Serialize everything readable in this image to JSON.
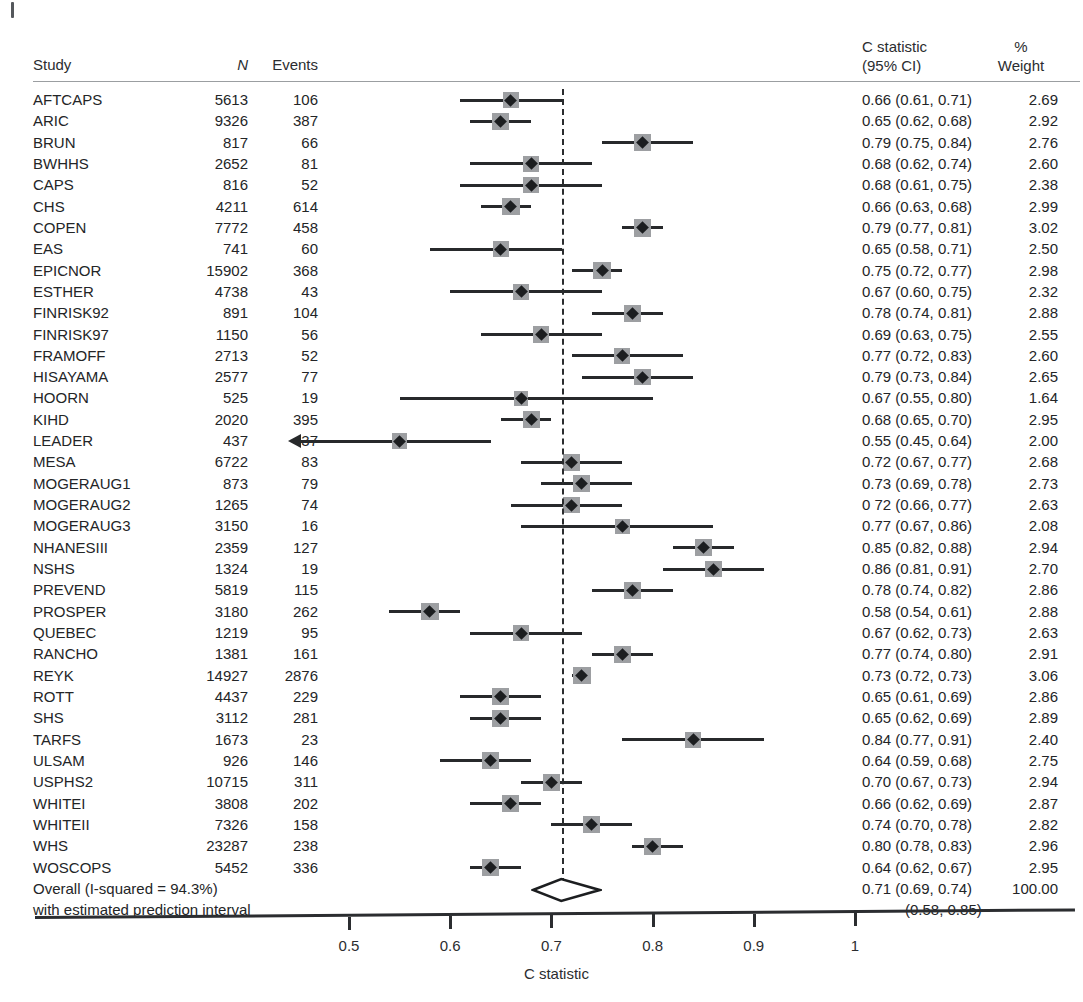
{
  "header": {
    "study": "Study",
    "n": "N",
    "events": "Events",
    "cstat_line1": "C statistic",
    "cstat_line2": "(95% CI)",
    "pct": "%",
    "weight": "Weight"
  },
  "summary": {
    "line1": "Overall (I-squared = 94.3%)",
    "line2": "with estimated prediction interval",
    "ci_label": "0.71 (0.69, 0.74)",
    "weight_label": "100.00",
    "pi_label": "(0.58, 0.85)",
    "estimate": 0.71,
    "lower": 0.69,
    "upper": 0.74,
    "pi_lower": 0.58,
    "pi_upper": 0.85
  },
  "axis": {
    "title": "C statistic",
    "ticks": [
      {
        "value": 0.5,
        "label": "0.5"
      },
      {
        "value": 0.6,
        "label": "0.6"
      },
      {
        "value": 0.7,
        "label": "0.7"
      },
      {
        "value": 0.8,
        "label": "0.8"
      },
      {
        "value": 0.9,
        "label": "0.9"
      },
      {
        "value": 1.0,
        "label": "1"
      }
    ],
    "min": 0.44,
    "max": 1.04
  },
  "colors": {
    "text": "#232527",
    "marker": "#1c1e20",
    "weight_box": "#9d9fa2",
    "line": "#27292b",
    "rule": "#9b9ea1",
    "background": "#ffffff"
  },
  "chart_data": {
    "type": "forest",
    "title": "",
    "xlabel": "C statistic",
    "ylabel": "",
    "xlim": [
      0.44,
      1.04
    ],
    "null_line": 0.71,
    "columns": [
      "Study",
      "N",
      "Events",
      "C statistic (95% CI)",
      "% Weight"
    ],
    "rows": [
      {
        "study": "AFTCAPS",
        "n": "5613",
        "events": "106",
        "est": 0.66,
        "lo": 0.61,
        "hi": 0.71,
        "weight": 2.69,
        "ci_label": "0.66 (0.61, 0.71)",
        "weight_label": "2.69",
        "truncated_left": false
      },
      {
        "study": "ARIC",
        "n": "9326",
        "events": "387",
        "est": 0.65,
        "lo": 0.62,
        "hi": 0.68,
        "weight": 2.92,
        "ci_label": "0.65 (0.62, 0.68)",
        "weight_label": "2.92",
        "truncated_left": false
      },
      {
        "study": "BRUN",
        "n": "817",
        "events": "66",
        "est": 0.79,
        "lo": 0.75,
        "hi": 0.84,
        "weight": 2.76,
        "ci_label": "0.79 (0.75, 0.84)",
        "weight_label": "2.76",
        "truncated_left": false
      },
      {
        "study": "BWHHS",
        "n": "2652",
        "events": "81",
        "est": 0.68,
        "lo": 0.62,
        "hi": 0.74,
        "weight": 2.6,
        "ci_label": "0.68 (0.62, 0.74)",
        "weight_label": "2.60",
        "truncated_left": false
      },
      {
        "study": "CAPS",
        "n": "816",
        "events": "52",
        "est": 0.68,
        "lo": 0.61,
        "hi": 0.75,
        "weight": 2.38,
        "ci_label": "0.68 (0.61, 0.75)",
        "weight_label": "2.38",
        "truncated_left": false
      },
      {
        "study": "CHS",
        "n": "4211",
        "events": "614",
        "est": 0.66,
        "lo": 0.63,
        "hi": 0.68,
        "weight": 2.99,
        "ci_label": "0.66 (0.63, 0.68)",
        "weight_label": "2.99",
        "truncated_left": false
      },
      {
        "study": "COPEN",
        "n": "7772",
        "events": "458",
        "est": 0.79,
        "lo": 0.77,
        "hi": 0.81,
        "weight": 3.02,
        "ci_label": "0.79 (0.77, 0.81)",
        "weight_label": "3.02",
        "truncated_left": false
      },
      {
        "study": "EAS",
        "n": "741",
        "events": "60",
        "est": 0.65,
        "lo": 0.58,
        "hi": 0.71,
        "weight": 2.5,
        "ci_label": "0.65 (0.58, 0.71)",
        "weight_label": "2.50",
        "truncated_left": false
      },
      {
        "study": "EPICNOR",
        "n": "15902",
        "events": "368",
        "est": 0.75,
        "lo": 0.72,
        "hi": 0.77,
        "weight": 2.98,
        "ci_label": "0.75 (0.72, 0.77)",
        "weight_label": "2.98",
        "truncated_left": false
      },
      {
        "study": "ESTHER",
        "n": "4738",
        "events": "43",
        "est": 0.67,
        "lo": 0.6,
        "hi": 0.75,
        "weight": 2.32,
        "ci_label": "0.67 (0.60, 0.75)",
        "weight_label": "2.32",
        "truncated_left": false
      },
      {
        "study": "FINRISK92",
        "n": "891",
        "events": "104",
        "est": 0.78,
        "lo": 0.74,
        "hi": 0.81,
        "weight": 2.88,
        "ci_label": "0.78 (0.74, 0.81)",
        "weight_label": "2.88",
        "truncated_left": false
      },
      {
        "study": "FINRISK97",
        "n": "1150",
        "events": "56",
        "est": 0.69,
        "lo": 0.63,
        "hi": 0.75,
        "weight": 2.55,
        "ci_label": "0.69 (0.63, 0.75)",
        "weight_label": "2.55",
        "truncated_left": false
      },
      {
        "study": "FRAMOFF",
        "n": "2713",
        "events": "52",
        "est": 0.77,
        "lo": 0.72,
        "hi": 0.83,
        "weight": 2.6,
        "ci_label": "0.77 (0.72, 0.83)",
        "weight_label": "2.60",
        "truncated_left": false
      },
      {
        "study": "HISAYAMA",
        "n": "2577",
        "events": "77",
        "est": 0.79,
        "lo": 0.73,
        "hi": 0.84,
        "weight": 2.65,
        "ci_label": "0.79 (0.73, 0.84)",
        "weight_label": "2.65",
        "truncated_left": false
      },
      {
        "study": "HOORN",
        "n": "525",
        "events": "19",
        "est": 0.67,
        "lo": 0.55,
        "hi": 0.8,
        "weight": 1.64,
        "ci_label": "0.67 (0.55, 0.80)",
        "weight_label": "1.64",
        "truncated_left": false
      },
      {
        "study": "KIHD",
        "n": "2020",
        "events": "395",
        "est": 0.68,
        "lo": 0.65,
        "hi": 0.7,
        "weight": 2.95,
        "ci_label": "0.68 (0.65, 0.70)",
        "weight_label": "2.95",
        "truncated_left": false
      },
      {
        "study": "LEADER",
        "n": "437",
        "events": "37",
        "est": 0.55,
        "lo": 0.45,
        "hi": 0.64,
        "weight": 2.0,
        "ci_label": "0.55 (0.45, 0.64)",
        "weight_label": "2.00",
        "truncated_left": true
      },
      {
        "study": "MESA",
        "n": "6722",
        "events": "83",
        "est": 0.72,
        "lo": 0.67,
        "hi": 0.77,
        "weight": 2.68,
        "ci_label": "0.72 (0.67, 0.77)",
        "weight_label": "2.68",
        "truncated_left": false
      },
      {
        "study": "MOGERAUG1",
        "n": "873",
        "events": "79",
        "est": 0.73,
        "lo": 0.69,
        "hi": 0.78,
        "weight": 2.73,
        "ci_label": "0.73 (0.69, 0.78)",
        "weight_label": "2.73",
        "truncated_left": false
      },
      {
        "study": "MOGERAUG2",
        "n": "1265",
        "events": "74",
        "est": 0.72,
        "lo": 0.66,
        "hi": 0.77,
        "weight": 2.63,
        "ci_label": "0 72 (0.66, 0.77)",
        "weight_label": "2.63",
        "truncated_left": false
      },
      {
        "study": "MOGERAUG3",
        "n": "3150",
        "events": "16",
        "est": 0.77,
        "lo": 0.67,
        "hi": 0.86,
        "weight": 2.08,
        "ci_label": "0.77 (0.67, 0.86)",
        "weight_label": "2.08",
        "truncated_left": false
      },
      {
        "study": "NHANESIII",
        "n": "2359",
        "events": "127",
        "est": 0.85,
        "lo": 0.82,
        "hi": 0.88,
        "weight": 2.94,
        "ci_label": "0.85 (0.82, 0.88)",
        "weight_label": "2.94",
        "truncated_left": false
      },
      {
        "study": "NSHS",
        "n": "1324",
        "events": "19",
        "est": 0.86,
        "lo": 0.81,
        "hi": 0.91,
        "weight": 2.7,
        "ci_label": "0.86 (0.81, 0.91)",
        "weight_label": "2.70",
        "truncated_left": false
      },
      {
        "study": "PREVEND",
        "n": "5819",
        "events": "115",
        "est": 0.78,
        "lo": 0.74,
        "hi": 0.82,
        "weight": 2.86,
        "ci_label": "0.78 (0.74, 0.82)",
        "weight_label": "2.86",
        "truncated_left": false
      },
      {
        "study": "PROSPER",
        "n": "3180",
        "events": "262",
        "est": 0.58,
        "lo": 0.54,
        "hi": 0.61,
        "weight": 2.88,
        "ci_label": "0.58 (0.54, 0.61)",
        "weight_label": "2.88",
        "truncated_left": false
      },
      {
        "study": "QUEBEC",
        "n": "1219",
        "events": "95",
        "est": 0.67,
        "lo": 0.62,
        "hi": 0.73,
        "weight": 2.63,
        "ci_label": "0.67 (0.62, 0.73)",
        "weight_label": "2.63",
        "truncated_left": false
      },
      {
        "study": "RANCHO",
        "n": "1381",
        "events": "161",
        "est": 0.77,
        "lo": 0.74,
        "hi": 0.8,
        "weight": 2.91,
        "ci_label": "0.77 (0.74, 0.80)",
        "weight_label": "2.91",
        "truncated_left": false
      },
      {
        "study": "REYK",
        "n": "14927",
        "events": "2876",
        "est": 0.73,
        "lo": 0.72,
        "hi": 0.73,
        "weight": 3.06,
        "ci_label": "0.73 (0.72, 0.73)",
        "weight_label": "3.06",
        "truncated_left": false
      },
      {
        "study": "ROTT",
        "n": "4437",
        "events": "229",
        "est": 0.65,
        "lo": 0.61,
        "hi": 0.69,
        "weight": 2.86,
        "ci_label": "0.65 (0.61, 0.69)",
        "weight_label": "2.86",
        "truncated_left": false
      },
      {
        "study": "SHS",
        "n": "3112",
        "events": "281",
        "est": 0.65,
        "lo": 0.62,
        "hi": 0.69,
        "weight": 2.89,
        "ci_label": "0.65 (0.62, 0.69)",
        "weight_label": "2.89",
        "truncated_left": false
      },
      {
        "study": "TARFS",
        "n": "1673",
        "events": "23",
        "est": 0.84,
        "lo": 0.77,
        "hi": 0.91,
        "weight": 2.4,
        "ci_label": "0.84 (0.77, 0.91)",
        "weight_label": "2.40",
        "truncated_left": false
      },
      {
        "study": "ULSAM",
        "n": "926",
        "events": "146",
        "est": 0.64,
        "lo": 0.59,
        "hi": 0.68,
        "weight": 2.75,
        "ci_label": "0.64 (0.59, 0.68)",
        "weight_label": "2.75",
        "truncated_left": false
      },
      {
        "study": "USPHS2",
        "n": "10715",
        "events": "311",
        "est": 0.7,
        "lo": 0.67,
        "hi": 0.73,
        "weight": 2.94,
        "ci_label": "0.70 (0.67, 0.73)",
        "weight_label": "2.94",
        "truncated_left": false
      },
      {
        "study": "WHITEI",
        "n": "3808",
        "events": "202",
        "est": 0.66,
        "lo": 0.62,
        "hi": 0.69,
        "weight": 2.87,
        "ci_label": "0.66 (0.62, 0.69)",
        "weight_label": "2.87",
        "truncated_left": false
      },
      {
        "study": "WHITEII",
        "n": "7326",
        "events": "158",
        "est": 0.74,
        "lo": 0.7,
        "hi": 0.78,
        "weight": 2.82,
        "ci_label": "0.74 (0.70, 0.78)",
        "weight_label": "2.82",
        "truncated_left": false
      },
      {
        "study": "WHS",
        "n": "23287",
        "events": "238",
        "est": 0.8,
        "lo": 0.78,
        "hi": 0.83,
        "weight": 2.96,
        "ci_label": "0.80 (0.78, 0.83)",
        "weight_label": "2.96",
        "truncated_left": false
      },
      {
        "study": "WOSCOPS",
        "n": "5452",
        "events": "336",
        "est": 0.64,
        "lo": 0.62,
        "hi": 0.67,
        "weight": 2.95,
        "ci_label": "0.64 (0.62, 0.67)",
        "weight_label": "2.95",
        "truncated_left": false
      }
    ]
  }
}
